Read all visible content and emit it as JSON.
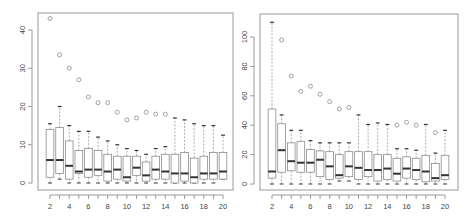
{
  "chart_data": [
    {
      "type": "boxplot",
      "title": "",
      "xlabel": "",
      "ylabel": "",
      "ylim": [
        -1.5,
        44
      ],
      "yticks": [
        0,
        10,
        20,
        30,
        40
      ],
      "xticks": [
        "2",
        "4",
        "6",
        "8",
        "10",
        "12",
        "14",
        "16",
        "18",
        "20"
      ],
      "grid": false,
      "categories": [
        "2",
        "3",
        "4",
        "5",
        "6",
        "7",
        "8",
        "9",
        "10",
        "11",
        "12",
        "13",
        "14",
        "15",
        "16",
        "17",
        "18",
        "19",
        "20"
      ],
      "boxes": [
        {
          "x": "2",
          "whisker_low": 0,
          "q1": 1.5,
          "median": 6,
          "q3": 14,
          "whisker_high": 15.5,
          "outliers": [
            43
          ]
        },
        {
          "x": "3",
          "whisker_low": 1,
          "q1": 2.5,
          "median": 6,
          "q3": 14.5,
          "whisker_high": 20,
          "outliers": [
            33.5
          ]
        },
        {
          "x": "4",
          "whisker_low": 0,
          "q1": 1,
          "median": 4.5,
          "q3": 11,
          "whisker_high": 15,
          "outliers": [
            30
          ]
        },
        {
          "x": "5",
          "whisker_low": 0,
          "q1": 2.5,
          "median": 3,
          "q3": 8.5,
          "whisker_high": 13.5,
          "outliers": [
            27
          ]
        },
        {
          "x": "6",
          "whisker_low": 0,
          "q1": 1.5,
          "median": 3.5,
          "q3": 9,
          "whisker_high": 13.5,
          "outliers": [
            22.5
          ]
        },
        {
          "x": "7",
          "whisker_low": 0,
          "q1": 2,
          "median": 3.5,
          "q3": 8.5,
          "whisker_high": 12,
          "outliers": [
            21
          ]
        },
        {
          "x": "8",
          "whisker_low": 0,
          "q1": 0.5,
          "median": 3,
          "q3": 7.5,
          "whisker_high": 11,
          "outliers": [
            21
          ]
        },
        {
          "x": "9",
          "whisker_low": 0,
          "q1": 1,
          "median": 3.5,
          "q3": 7,
          "whisker_high": 10,
          "outliers": [
            18.5
          ]
        },
        {
          "x": "10",
          "whisker_low": 0,
          "q1": 0.5,
          "median": 1.5,
          "q3": 7,
          "whisker_high": 9,
          "outliers": [
            16.5
          ]
        },
        {
          "x": "11",
          "whisker_low": 0,
          "q1": 2,
          "median": 4,
          "q3": 7,
          "whisker_high": 8.5,
          "outliers": [
            17
          ]
        },
        {
          "x": "12",
          "whisker_low": 0,
          "q1": 0.5,
          "median": 2,
          "q3": 5.5,
          "whisker_high": 7.5,
          "outliers": [
            18.5
          ]
        },
        {
          "x": "13",
          "whisker_low": 0,
          "q1": 1,
          "median": 3.5,
          "q3": 7,
          "whisker_high": 9,
          "outliers": [
            18
          ]
        },
        {
          "x": "14",
          "whisker_low": 0,
          "q1": 1,
          "median": 3,
          "q3": 7.5,
          "whisker_high": 9.5,
          "outliers": [
            18
          ]
        },
        {
          "x": "15",
          "whisker_low": 0,
          "q1": 0,
          "median": 2.5,
          "q3": 7.5,
          "whisker_high": 17,
          "outliers": []
        },
        {
          "x": "16",
          "whisker_low": 0,
          "q1": 0.5,
          "median": 2.5,
          "q3": 8,
          "whisker_high": 16.5,
          "outliers": []
        },
        {
          "x": "17",
          "whisker_low": 0,
          "q1": 0,
          "median": 1.5,
          "q3": 6.5,
          "whisker_high": 15.5,
          "outliers": []
        },
        {
          "x": "18",
          "whisker_low": 0,
          "q1": 1,
          "median": 2.5,
          "q3": 7,
          "whisker_high": 15,
          "outliers": []
        },
        {
          "x": "19",
          "whisker_low": 0,
          "q1": 1,
          "median": 2.5,
          "q3": 8,
          "whisker_high": 15,
          "outliers": []
        },
        {
          "x": "20",
          "whisker_low": 1,
          "q1": 1,
          "median": 3,
          "q3": 8,
          "whisker_high": 12.5,
          "outliers": []
        }
      ]
    },
    {
      "type": "boxplot",
      "title": "",
      "xlabel": "",
      "ylabel": "",
      "ylim": [
        -3,
        110
      ],
      "yticks": [
        0,
        20,
        40,
        60,
        80,
        100
      ],
      "xticks": [
        "2",
        "4",
        "6",
        "8",
        "10",
        "12",
        "14",
        "16",
        "18",
        "20"
      ],
      "grid": false,
      "categories": [
        "2",
        "3",
        "4",
        "5",
        "6",
        "7",
        "8",
        "9",
        "10",
        "11",
        "12",
        "13",
        "14",
        "15",
        "16",
        "17",
        "18",
        "19",
        "20"
      ],
      "boxes": [
        {
          "x": "2",
          "whisker_low": 0,
          "q1": 4,
          "median": 8.5,
          "q3": 51,
          "whisker_high": 110,
          "outliers": []
        },
        {
          "x": "3",
          "whisker_low": 0,
          "q1": 8,
          "median": 23,
          "q3": 41,
          "whisker_high": 47,
          "outliers": [
            98
          ]
        },
        {
          "x": "4",
          "whisker_low": 0,
          "q1": 9,
          "median": 15.5,
          "q3": 28,
          "whisker_high": 36.5,
          "outliers": [
            73.5
          ]
        },
        {
          "x": "5",
          "whisker_low": 0,
          "q1": 8,
          "median": 14.5,
          "q3": 29,
          "whisker_high": 36.5,
          "outliers": [
            63
          ]
        },
        {
          "x": "6",
          "whisker_low": 0,
          "q1": 8,
          "median": 14.5,
          "q3": 23.5,
          "whisker_high": 29.5,
          "outliers": [
            66.5
          ]
        },
        {
          "x": "7",
          "whisker_low": 0,
          "q1": 5,
          "median": 16.5,
          "q3": 22.5,
          "whisker_high": 28,
          "outliers": [
            61
          ]
        },
        {
          "x": "8",
          "whisker_low": 0,
          "q1": 3,
          "median": 12,
          "q3": 22,
          "whisker_high": 28,
          "outliers": [
            56
          ]
        },
        {
          "x": "9",
          "whisker_low": 2,
          "q1": 4,
          "median": 6,
          "q3": 20,
          "whisker_high": 28,
          "outliers": [
            51
          ]
        },
        {
          "x": "10",
          "whisker_low": 2,
          "q1": 5,
          "median": 12,
          "q3": 22,
          "whisker_high": 28,
          "outliers": [
            52
          ]
        },
        {
          "x": "11",
          "whisker_low": 0,
          "q1": 3,
          "median": 11,
          "q3": 22,
          "whisker_high": 47,
          "outliers": []
        },
        {
          "x": "12",
          "whisker_low": 0,
          "q1": 5,
          "median": 9.5,
          "q3": 22,
          "whisker_high": 40.5,
          "outliers": []
        },
        {
          "x": "13",
          "whisker_low": 0,
          "q1": 2,
          "median": 9.5,
          "q3": 20,
          "whisker_high": 41.5,
          "outliers": []
        },
        {
          "x": "14",
          "whisker_low": 0,
          "q1": 3,
          "median": 10.5,
          "q3": 20,
          "whisker_high": 40.5,
          "outliers": []
        },
        {
          "x": "15",
          "whisker_low": 0,
          "q1": 2,
          "median": 7,
          "q3": 17.5,
          "whisker_high": 24,
          "outliers": [
            40
          ]
        },
        {
          "x": "16",
          "whisker_low": 0,
          "q1": 4,
          "median": 10.5,
          "q3": 18.5,
          "whisker_high": 24,
          "outliers": [
            42
          ]
        },
        {
          "x": "17",
          "whisker_low": 0,
          "q1": 3,
          "median": 9.5,
          "q3": 17.5,
          "whisker_high": 23,
          "outliers": [
            40
          ]
        },
        {
          "x": "18",
          "whisker_low": 0,
          "q1": 1.5,
          "median": 8.5,
          "q3": 19.5,
          "whisker_high": 40.5,
          "outliers": []
        },
        {
          "x": "19",
          "whisker_low": 0,
          "q1": 2,
          "median": 4,
          "q3": 14,
          "whisker_high": 21,
          "outliers": [
            35
          ]
        },
        {
          "x": "20",
          "whisker_low": 0,
          "q1": 3,
          "median": 6,
          "q3": 19.5,
          "whisker_high": 36.5,
          "outliers": []
        }
      ]
    }
  ],
  "panels": [
    {
      "y_tick_labels": [
        "0",
        "10",
        "20",
        "30",
        "40"
      ],
      "x_tick_labels": [
        "2",
        "4",
        "6",
        "8",
        "10",
        "12",
        "14",
        "16",
        "18",
        "20"
      ]
    },
    {
      "y_tick_labels": [
        "0",
        "20",
        "40",
        "60",
        "80",
        "100"
      ],
      "x_tick_labels": [
        "2",
        "4",
        "6",
        "8",
        "10",
        "12",
        "14",
        "16",
        "18",
        "20"
      ]
    }
  ],
  "colors": {
    "frame": "#9a9a9a",
    "box": "#8c8c8c",
    "median": "#333333",
    "whisker": "#9a9a9a",
    "outlier": "#8c8c8c",
    "tick_text": "#444444"
  }
}
